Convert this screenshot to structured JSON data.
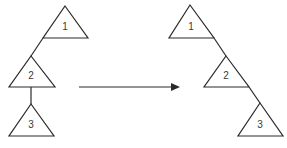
{
  "diagram": {
    "type": "tree-rotation",
    "stroke_color": "#2a2a2a",
    "label_color": "#3a3a3a",
    "before": {
      "nodes": [
        {
          "id": "1",
          "label": "1"
        },
        {
          "id": "2",
          "label": "2"
        },
        {
          "id": "3",
          "label": "3"
        }
      ],
      "edges": [
        {
          "from": "1",
          "to": "2",
          "side": "left"
        },
        {
          "from": "2",
          "to": "3",
          "side": "center"
        }
      ]
    },
    "arrow": {
      "direction": "right"
    },
    "after": {
      "nodes": [
        {
          "id": "1",
          "label": "1"
        },
        {
          "id": "2",
          "label": "2"
        },
        {
          "id": "3",
          "label": "3"
        }
      ],
      "edges": [
        {
          "from": "1",
          "to": "2",
          "side": "right"
        },
        {
          "from": "2",
          "to": "3",
          "side": "right"
        }
      ]
    }
  }
}
